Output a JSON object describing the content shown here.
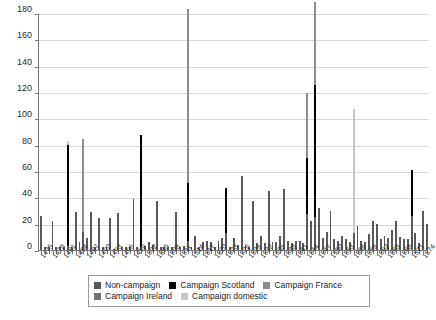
{
  "chart_data": {
    "type": "bar",
    "title": "",
    "subtitle": "",
    "xlabel": "",
    "ylabel": "",
    "ylim": [
      0,
      180
    ],
    "ytick_step": 20,
    "ytick_labels": [
      "0",
      "20",
      "40",
      "60",
      "80",
      "100",
      "120",
      "140",
      "160",
      "180"
    ],
    "grid": true,
    "stacked": true,
    "legend_position": "bottom",
    "xlabel_interval": 3,
    "x_start": 1475,
    "x_end": 1575,
    "categories": [
      "1475",
      "1476",
      "1477",
      "1478",
      "1479",
      "1480",
      "1481",
      "1482",
      "1483",
      "1484",
      "1485",
      "1486",
      "1487",
      "1488",
      "1489",
      "1490",
      "1491",
      "1492",
      "1493",
      "1494",
      "1495",
      "1496",
      "1497",
      "1498",
      "1499",
      "1500",
      "1501",
      "1502",
      "1503",
      "1504",
      "1505",
      "1506",
      "1507",
      "1508",
      "1509",
      "1510",
      "1511",
      "1512",
      "1513",
      "1514",
      "1515",
      "1516",
      "1517",
      "1518",
      "1519",
      "1520",
      "1521",
      "1522",
      "1523",
      "1524",
      "1525",
      "1526",
      "1527",
      "1528",
      "1529",
      "1530",
      "1531",
      "1532",
      "1533",
      "1534",
      "1535",
      "1536",
      "1537",
      "1538",
      "1539",
      "1540",
      "1541",
      "1542",
      "1543",
      "1544",
      "1545",
      "1546",
      "1547",
      "1548",
      "1549",
      "1550",
      "1551",
      "1552",
      "1553",
      "1554",
      "1555",
      "1556",
      "1557",
      "1558",
      "1559",
      "1560",
      "1561",
      "1562",
      "1563",
      "1564",
      "1565",
      "1566",
      "1567",
      "1568",
      "1569",
      "1570",
      "1571",
      "1572",
      "1573",
      "1574",
      "1575"
    ],
    "series": [
      {
        "name": "Non-campaign",
        "color": "#595959",
        "values": [
          26,
          2,
          2,
          22,
          2,
          2,
          2,
          3,
          2,
          29,
          6,
          14,
          9,
          29,
          2,
          24,
          2,
          2,
          24,
          1,
          28,
          2,
          2,
          2,
          39,
          2,
          2,
          3,
          6,
          4,
          37,
          2,
          2,
          2,
          2,
          29,
          2,
          3,
          7,
          2,
          11,
          2,
          6,
          7,
          6,
          2,
          7,
          9,
          13,
          2,
          9,
          4,
          56,
          4,
          2,
          37,
          5,
          11,
          5,
          45,
          6,
          6,
          11,
          46,
          7,
          5,
          7,
          7,
          5,
          27,
          22,
          25,
          32,
          9,
          14,
          30,
          8,
          7,
          11,
          8,
          6,
          13,
          18,
          7,
          6,
          12,
          22,
          20,
          8,
          11,
          9,
          15,
          22,
          10,
          8,
          8,
          26,
          13,
          5,
          30,
          20
        ]
      },
      {
        "name": "Campaign Scotland",
        "color": "#000000",
        "values": [
          0,
          0,
          0,
          0,
          0,
          0,
          0,
          77,
          0,
          0,
          0,
          0,
          0,
          0,
          0,
          0,
          0,
          0,
          0,
          0,
          0,
          0,
          0,
          0,
          0,
          0,
          85,
          0,
          0,
          0,
          0,
          0,
          0,
          0,
          0,
          0,
          0,
          0,
          44,
          0,
          0,
          0,
          0,
          0,
          0,
          0,
          0,
          0,
          34,
          0,
          0,
          0,
          0,
          0,
          0,
          0,
          0,
          0,
          0,
          0,
          0,
          0,
          0,
          0,
          0,
          0,
          0,
          0,
          0,
          43,
          0,
          100,
          0,
          0,
          0,
          0,
          0,
          0,
          0,
          0,
          0,
          0,
          0,
          0,
          0,
          0,
          0,
          0,
          0,
          0,
          0,
          0,
          0,
          0,
          0,
          0,
          35,
          0,
          0,
          0,
          0
        ]
      },
      {
        "name": "Campaign France",
        "color": "#8c8c8c",
        "values": [
          0,
          0,
          0,
          0,
          0,
          0,
          0,
          0,
          0,
          0,
          0,
          70,
          0,
          0,
          0,
          0,
          0,
          0,
          0,
          0,
          0,
          0,
          0,
          0,
          0,
          0,
          0,
          0,
          0,
          0,
          0,
          0,
          0,
          0,
          0,
          0,
          0,
          0,
          132,
          0,
          0,
          0,
          0,
          0,
          0,
          0,
          0,
          0,
          0,
          0,
          0,
          0,
          0,
          0,
          0,
          0,
          0,
          0,
          0,
          0,
          0,
          0,
          0,
          0,
          0,
          0,
          0,
          0,
          0,
          49,
          0,
          63,
          0,
          0,
          0,
          0,
          0,
          0,
          0,
          0,
          0,
          0,
          0,
          0,
          0,
          0,
          0,
          0,
          0,
          0,
          0,
          0,
          0,
          0,
          0,
          0,
          0,
          0,
          0,
          0,
          0
        ]
      },
      {
        "name": "Campaign Ireland",
        "color": "#737373",
        "values": [
          0,
          0,
          0,
          0,
          0,
          0,
          0,
          0,
          0,
          0,
          0,
          0,
          0,
          0,
          0,
          0,
          0,
          0,
          0,
          0,
          0,
          0,
          0,
          0,
          0,
          0,
          0,
          0,
          0,
          0,
          0,
          0,
          0,
          0,
          0,
          0,
          0,
          0,
          0,
          0,
          0,
          0,
          0,
          0,
          0,
          0,
          0,
          0,
          0,
          0,
          0,
          0,
          0,
          0,
          0,
          0,
          0,
          0,
          0,
          0,
          0,
          0,
          0,
          0,
          0,
          0,
          0,
          0,
          0,
          0,
          0,
          0,
          0,
          0,
          0,
          0,
          0,
          0,
          0,
          0,
          0,
          0,
          0,
          0,
          0,
          0,
          0,
          0,
          0,
          0,
          0,
          0,
          0,
          0,
          0,
          0,
          0,
          0,
          0,
          0,
          0
        ]
      },
      {
        "name": "Campaign domestic",
        "color": "#c8c8c8",
        "values": [
          0,
          0,
          0,
          0,
          0,
          0,
          0,
          3,
          0,
          0,
          0,
          0,
          0,
          0,
          0,
          0,
          0,
          0,
          0,
          0,
          0,
          0,
          0,
          0,
          0,
          0,
          0,
          0,
          0,
          0,
          0,
          0,
          0,
          0,
          0,
          0,
          0,
          0,
          0,
          0,
          0,
          0,
          0,
          0,
          0,
          0,
          0,
          0,
          0,
          0,
          0,
          0,
          0,
          0,
          0,
          0,
          0,
          0,
          0,
          0,
          0,
          0,
          0,
          0,
          0,
          0,
          0,
          0,
          0,
          0,
          0,
          0,
          0,
          0,
          0,
          0,
          0,
          0,
          0,
          0,
          0,
          94,
          0,
          0,
          0,
          0,
          0,
          0,
          0,
          0,
          0,
          0,
          0,
          0,
          0,
          0,
          0,
          0,
          0,
          0,
          0
        ]
      }
    ],
    "notable_peaks": [
      {
        "year": "1513",
        "total": 176
      },
      {
        "year": "1546",
        "total": 163
      },
      {
        "year": "1556",
        "total": 112
      },
      {
        "year": "1544",
        "total": 92
      },
      {
        "year": "1486",
        "total": 84
      },
      {
        "year": "1501",
        "total": 85
      },
      {
        "year": "1482",
        "total": 80
      }
    ]
  },
  "legend": {
    "rows": [
      [
        {
          "label": "Non-campaign",
          "color": "#595959",
          "name": "non-campaign"
        },
        {
          "label": "Campaign Scotland",
          "color": "#000000",
          "name": "campaign-scotland"
        },
        {
          "label": "Campaign France",
          "color": "#8c8c8c",
          "name": "campaign-france"
        }
      ],
      [
        {
          "label": "Campaign Ireland",
          "color": "#737373",
          "name": "campaign-ireland"
        },
        {
          "label": "Campaign domestic",
          "color": "#c8c8c8",
          "name": "campaign-domestic"
        }
      ]
    ]
  }
}
